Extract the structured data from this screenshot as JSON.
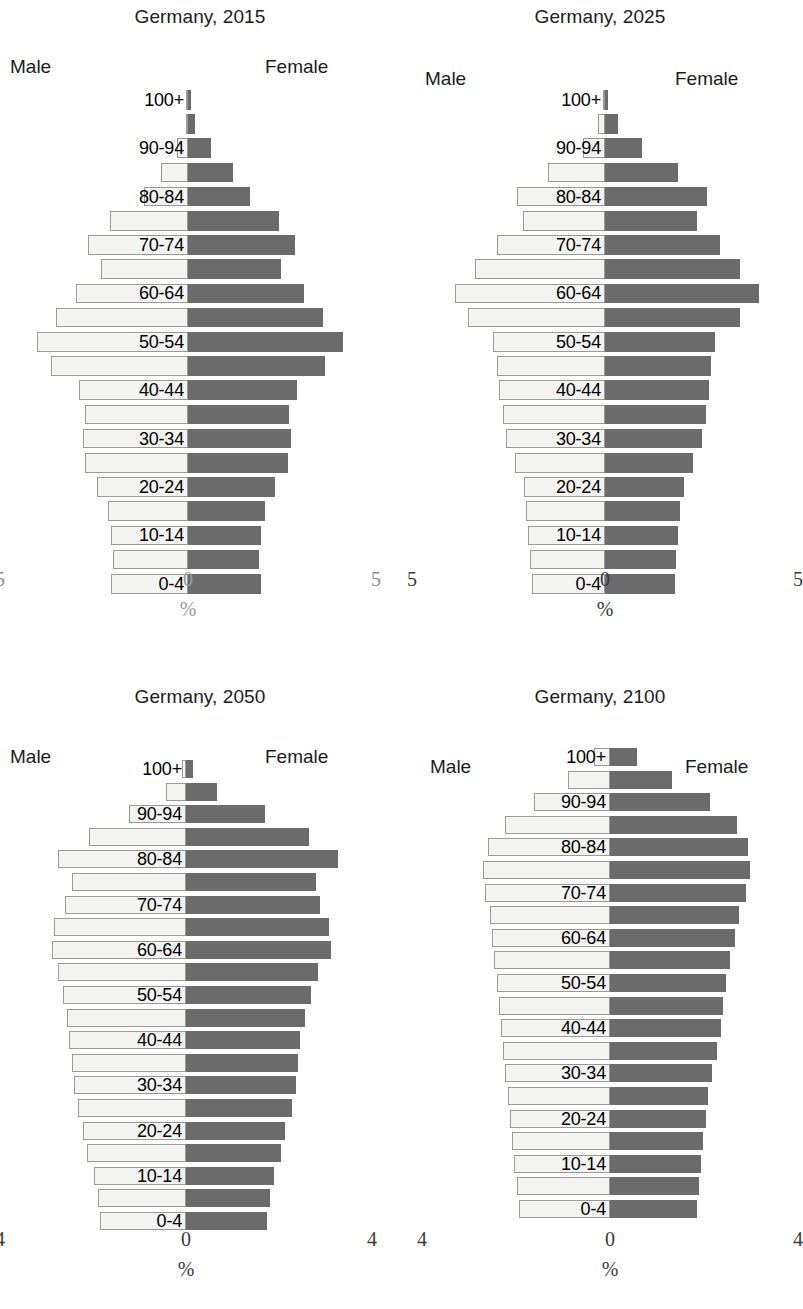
{
  "figure": {
    "axis_unit": "%",
    "male_label": "Male",
    "female_label": "Female",
    "male_color": "#f3f3f1",
    "female_color": "#6b6b6b"
  },
  "panels": [
    {
      "id": "p1",
      "title": "Germany, 2015",
      "tick_left": "5",
      "tick_mid": "0",
      "tick_right": "5"
    },
    {
      "id": "p2",
      "title": "Germany, 2025",
      "tick_left": "5",
      "tick_mid": "0",
      "tick_right": "5"
    },
    {
      "id": "p3",
      "title": "Germany, 2050",
      "tick_left": "4",
      "tick_mid": "0",
      "tick_right": "4"
    },
    {
      "id": "p4",
      "title": "Germany, 2100",
      "tick_left": "4",
      "tick_mid": "0",
      "tick_right": "4"
    }
  ],
  "chart_data": [
    {
      "type": "bar",
      "title": "Germany, 2015",
      "subtitle": "",
      "xlabel": "%",
      "ylabel": "",
      "orientation": "population-pyramid",
      "xlim": [
        -5,
        5
      ],
      "xticks": [
        5,
        0,
        5
      ],
      "grid": false,
      "legend": [
        "Male",
        "Female"
      ],
      "legend_position": "inline-left-right",
      "categories": [
        "0-4",
        "5-9",
        "10-14",
        "15-19",
        "20-24",
        "25-29",
        "30-34",
        "35-39",
        "40-44",
        "45-49",
        "50-54",
        "55-59",
        "60-64",
        "65-69",
        "70-74",
        "75-79",
        "80-84",
        "85-89",
        "90-94",
        "95-99",
        "100+"
      ],
      "series": [
        {
          "name": "Male",
          "values": [
            2.15,
            2.1,
            2.15,
            2.25,
            2.55,
            2.9,
            2.95,
            2.9,
            3.05,
            3.85,
            4.25,
            3.7,
            3.15,
            2.45,
            2.8,
            2.2,
            1.25,
            0.75,
            0.3,
            0.07,
            0.01
          ]
        },
        {
          "name": "Female",
          "values": [
            2.05,
            2.0,
            2.05,
            2.15,
            2.45,
            2.8,
            2.9,
            2.85,
            3.05,
            3.85,
            4.35,
            3.8,
            3.25,
            2.6,
            3.0,
            2.55,
            1.75,
            1.25,
            0.65,
            0.2,
            0.03
          ]
        }
      ]
    },
    {
      "type": "bar",
      "title": "Germany, 2025",
      "subtitle": "",
      "xlabel": "%",
      "ylabel": "",
      "orientation": "population-pyramid",
      "xlim": [
        -5,
        5
      ],
      "xticks": [
        5,
        0,
        5
      ],
      "grid": false,
      "legend": [
        "Male",
        "Female"
      ],
      "legend_position": "inline-left-right",
      "categories": [
        "0-4",
        "5-9",
        "10-14",
        "15-19",
        "20-24",
        "25-29",
        "30-34",
        "35-39",
        "40-44",
        "45-49",
        "50-54",
        "55-59",
        "60-64",
        "65-69",
        "70-74",
        "75-79",
        "80-84",
        "85-89",
        "90-94",
        "95-99",
        "100+"
      ],
      "series": [
        {
          "name": "Male",
          "values": [
            2.0,
            2.05,
            2.1,
            2.15,
            2.2,
            2.45,
            2.7,
            2.8,
            2.9,
            2.95,
            3.05,
            3.75,
            4.1,
            3.55,
            2.95,
            2.25,
            2.4,
            1.55,
            0.6,
            0.18,
            0.03
          ]
        },
        {
          "name": "Female",
          "values": [
            1.9,
            1.95,
            2.0,
            2.05,
            2.15,
            2.4,
            2.65,
            2.75,
            2.85,
            2.9,
            3.0,
            3.7,
            4.2,
            3.7,
            3.15,
            2.5,
            2.8,
            2.0,
            1.0,
            0.35,
            0.07
          ]
        }
      ]
    },
    {
      "type": "bar",
      "title": "Germany, 2050",
      "subtitle": "",
      "xlabel": "%",
      "ylabel": "",
      "orientation": "population-pyramid",
      "xlim": [
        -4,
        4
      ],
      "xticks": [
        4,
        0,
        4
      ],
      "grid": false,
      "legend": [
        "Male",
        "Female"
      ],
      "legend_position": "inline-left-right",
      "categories": [
        "0-4",
        "5-9",
        "10-14",
        "15-19",
        "20-24",
        "25-29",
        "30-34",
        "35-39",
        "40-44",
        "45-49",
        "50-54",
        "55-59",
        "60-64",
        "65-69",
        "70-74",
        "75-79",
        "80-84",
        "85-89",
        "90-94",
        "95-99",
        "100+"
      ],
      "series": [
        {
          "name": "Male",
          "values": [
            1.95,
            2.0,
            2.1,
            2.25,
            2.35,
            2.45,
            2.55,
            2.6,
            2.65,
            2.7,
            2.8,
            2.9,
            3.05,
            3.0,
            2.75,
            2.6,
            2.9,
            2.2,
            1.3,
            0.45,
            0.08
          ]
        },
        {
          "name": "Female",
          "values": [
            1.85,
            1.9,
            2.0,
            2.15,
            2.25,
            2.4,
            2.5,
            2.55,
            2.6,
            2.7,
            2.85,
            3.0,
            3.3,
            3.25,
            3.05,
            2.95,
            3.45,
            2.8,
            1.8,
            0.7,
            0.15
          ]
        }
      ]
    },
    {
      "type": "bar",
      "title": "Germany, 2100",
      "subtitle": "",
      "xlabel": "%",
      "ylabel": "",
      "orientation": "population-pyramid",
      "xlim": [
        -4,
        4
      ],
      "xticks": [
        4,
        0,
        4
      ],
      "grid": false,
      "legend": [
        "Male",
        "Female"
      ],
      "legend_position": "inline-left-right",
      "categories": [
        "0-4",
        "5-9",
        "10-14",
        "15-19",
        "20-24",
        "25-29",
        "30-34",
        "35-39",
        "40-44",
        "45-49",
        "50-54",
        "55-59",
        "60-64",
        "65-69",
        "70-74",
        "75-79",
        "80-84",
        "85-89",
        "90-94",
        "95-99",
        "100+"
      ],
      "series": [
        {
          "name": "Male",
          "values": [
            2.05,
            2.1,
            2.15,
            2.2,
            2.25,
            2.3,
            2.35,
            2.4,
            2.45,
            2.5,
            2.55,
            2.6,
            2.65,
            2.7,
            2.8,
            2.85,
            2.75,
            2.35,
            1.7,
            0.95,
            0.35
          ]
        },
        {
          "name": "Female",
          "values": [
            1.95,
            2.0,
            2.05,
            2.1,
            2.15,
            2.2,
            2.3,
            2.4,
            2.5,
            2.55,
            2.6,
            2.7,
            2.8,
            2.9,
            3.05,
            3.15,
            3.1,
            2.85,
            2.25,
            1.4,
            0.6
          ]
        }
      ]
    }
  ]
}
